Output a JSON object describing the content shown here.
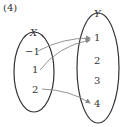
{
  "problem_label": "(4)",
  "domain_set": {
    "name": "X",
    "elements": [
      "−1",
      "1",
      "2"
    ]
  },
  "codomain_set": {
    "name": "Y",
    "elements": [
      "1",
      "2",
      "3",
      "4"
    ]
  },
  "mappings": [
    {
      "from": "−1",
      "to": "1"
    },
    {
      "from": "1",
      "to": "1"
    },
    {
      "from": "2",
      "to": "4"
    }
  ],
  "colors": {
    "oval": "#333333",
    "arrow": "#888888",
    "text": "#333333"
  }
}
